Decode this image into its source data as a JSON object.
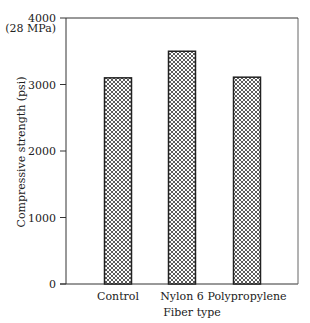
{
  "chart_data": {
    "type": "bar",
    "title": "",
    "xlabel": "Fiber type",
    "ylabel": "Compressive strength (psi)",
    "categories": [
      "Control",
      "Nylon 6",
      "Polypropylene"
    ],
    "values": [
      3100,
      3500,
      3110
    ],
    "ylim": [
      0,
      4000
    ],
    "yticks": [
      0,
      1000,
      2000,
      3000,
      4000
    ],
    "ytick_labels": [
      "0",
      "1000",
      "2000",
      "3000",
      "4000"
    ],
    "annotations": [
      "(28 MPa)"
    ],
    "grid": false,
    "legend": null,
    "bar_fill": "crosshatch",
    "colors": {
      "bar_edge": "#222222",
      "hatch": "#333333",
      "axis": "#333333"
    }
  }
}
